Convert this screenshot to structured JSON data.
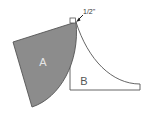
{
  "diagram": {
    "shape_a": {
      "label": "A",
      "fill": "#8c8c8c",
      "stroke": "#555555",
      "label_color": "#e6e6e6"
    },
    "shape_b": {
      "label": "B",
      "fill": "#ffffff",
      "stroke": "#555555",
      "label_color": "#555555"
    },
    "dimension": {
      "label": "1/2\"",
      "color": "#333333"
    }
  }
}
